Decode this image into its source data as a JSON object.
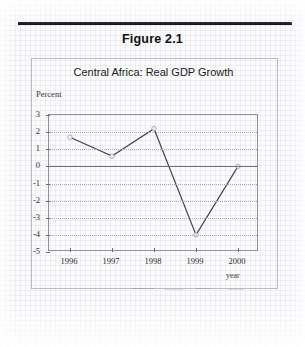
{
  "figure": {
    "number_label": "Figure 2.1",
    "top_rule": true
  },
  "chart_data": {
    "type": "line",
    "title": "Central Africa: Real GDP Growth",
    "xlabel": "year",
    "ylabel": "Percent",
    "categories": [
      "1996",
      "1997",
      "1998",
      "1999",
      "2000"
    ],
    "values": [
      1.7,
      0.6,
      2.2,
      -4.0,
      0.0
    ],
    "series": [
      {
        "name": "Real GDP Growth",
        "values": [
          1.7,
          0.6,
          2.2,
          -4.0,
          0.0
        ]
      }
    ],
    "ylim": [
      -5,
      3
    ],
    "ytick_values": [
      3,
      2,
      1,
      0,
      -1,
      -2,
      -3,
      -4,
      -5
    ],
    "ytick_labels": [
      "3",
      "2",
      "1",
      "0",
      "-1",
      "-2",
      "-3",
      "-4",
      "-5"
    ],
    "xtick_labels": [
      "1996",
      "1997",
      "1998",
      "1999",
      "2000"
    ],
    "grid": "horizontal-dotted",
    "zero_line": true,
    "legend": "none",
    "marker": "circle-open",
    "line_color": "#44464c",
    "grid_color": "#a9adb6",
    "axis_color": "#8e9199"
  },
  "colors": {
    "page_background": "#fbfbfc",
    "rule": "#0b0b0b",
    "text": "#1b1b1b",
    "box_border": "#b9bcc4"
  }
}
